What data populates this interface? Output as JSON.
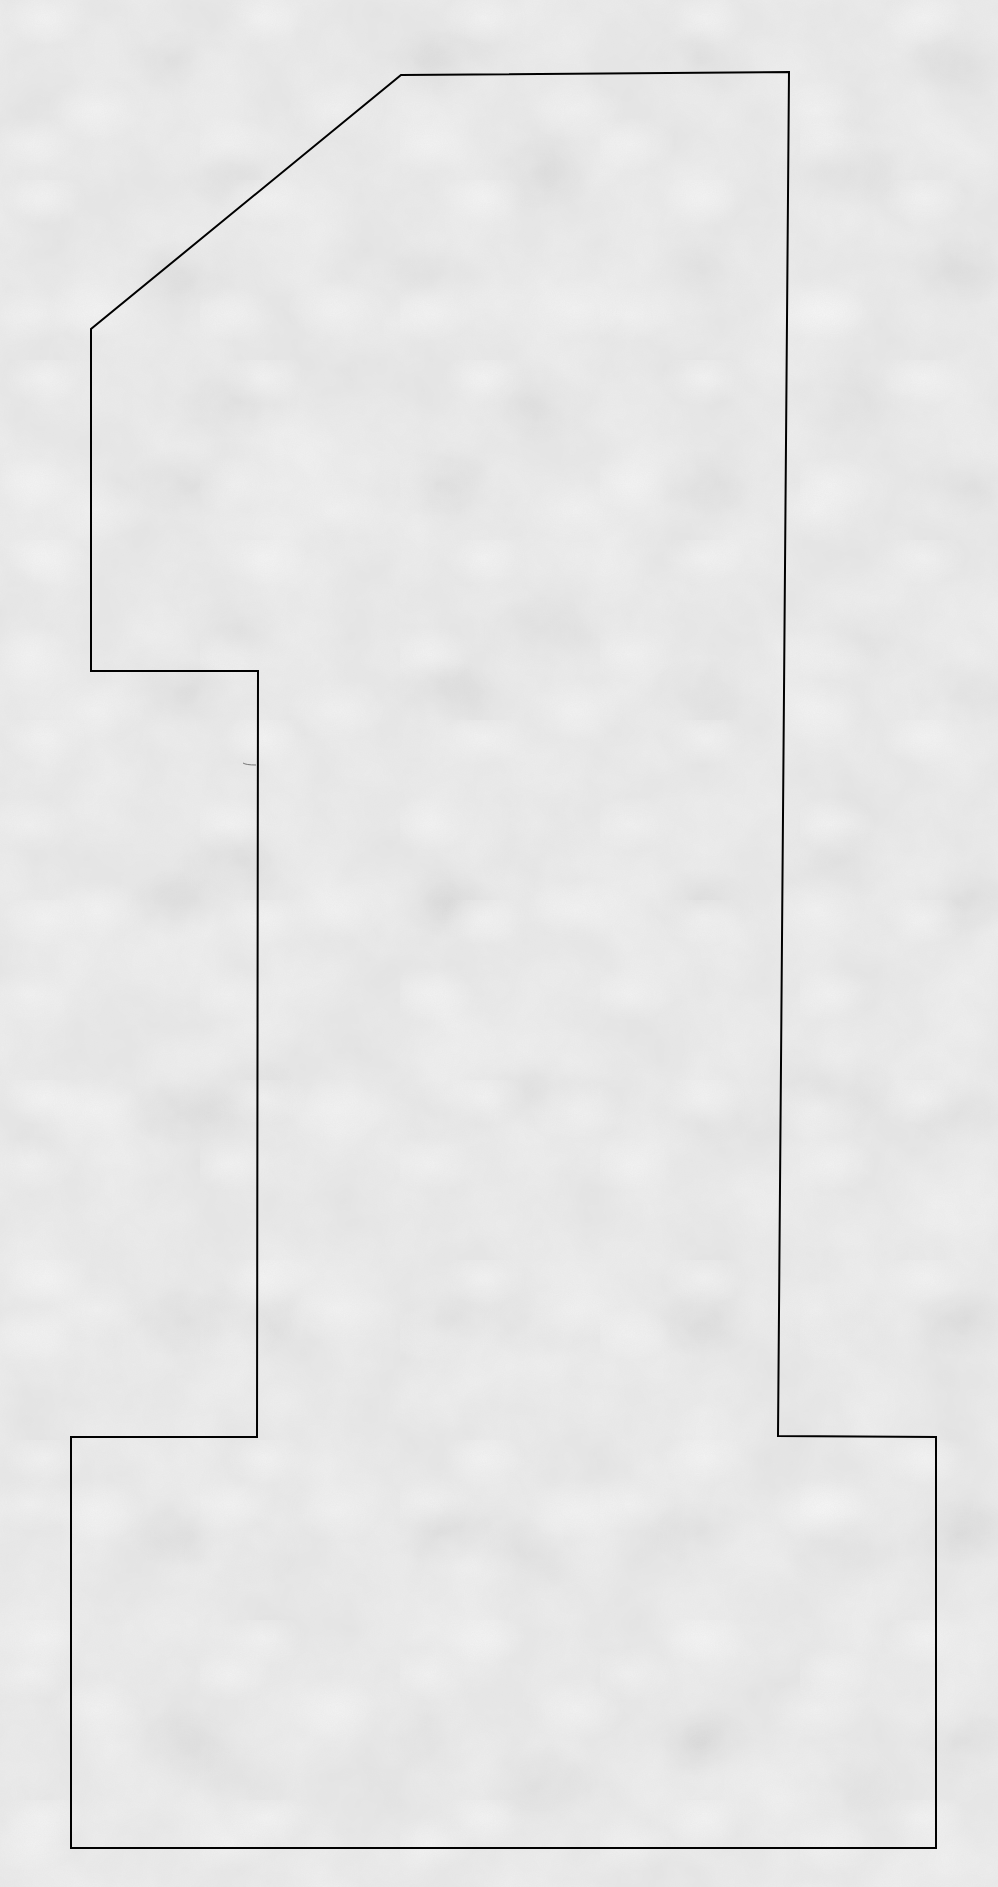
{
  "figure": {
    "background_color": "#e4e4e4",
    "stroke_color": "#000000",
    "stroke_width": 2,
    "outline_points": "401,75 789,72 778,1436 936,1437 936,1848 71,1848 71,1437 257,1437 258,671 91,671 91,329"
  }
}
